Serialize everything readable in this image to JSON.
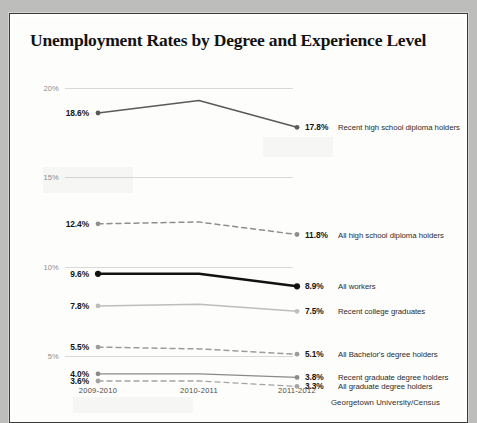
{
  "chart_data": {
    "type": "line",
    "title": "Unemployment Rates by Degree and Experience Level",
    "xlabel": "",
    "ylabel": "",
    "ylim": [
      2.5,
      21.0
    ],
    "yticks": [
      "20%",
      "15%",
      "10%",
      "5%"
    ],
    "ytick_values": [
      20,
      15,
      10,
      5
    ],
    "grid": true,
    "legend_position": "right-of-endpoints",
    "categories": [
      "2009-2010",
      "2010-2011",
      "2011-2012"
    ],
    "source": "Georgetown University/Census",
    "series": [
      {
        "name": "Recent high school diploma holders",
        "values": [
          18.6,
          19.3,
          17.8
        ],
        "start_label": "18.6%",
        "end_label": "17.8%",
        "style": "solid",
        "color": "#5a5a5a",
        "width": 1.6
      },
      {
        "name": "All high school diploma holders",
        "values": [
          12.4,
          12.5,
          11.8
        ],
        "start_label": "12.4%",
        "end_label": "11.8%",
        "style": "dashed",
        "color": "#8e8e8e",
        "width": 1.5
      },
      {
        "name": "All workers",
        "values": [
          9.6,
          9.6,
          8.9
        ],
        "start_label": "9.6%",
        "end_label": "8.9%",
        "style": "solid",
        "color": "#121212",
        "width": 2.4
      },
      {
        "name": "Recent college graduates",
        "values": [
          7.8,
          7.9,
          7.5
        ],
        "start_label": "7.8%",
        "end_label": "7.5%",
        "style": "solid",
        "color": "#bdbdbd",
        "width": 1.6
      },
      {
        "name": "All Bachelor's degree holders",
        "values": [
          5.5,
          5.4,
          5.1
        ],
        "start_label": "5.5%",
        "end_label": "5.1%",
        "style": "dashed",
        "color": "#9c9c9c",
        "width": 1.5
      },
      {
        "name": "Recent graduate degree holders",
        "values": [
          4.0,
          4.0,
          3.8
        ],
        "start_label": "4.0%",
        "end_label": "3.8%",
        "style": "solid",
        "color": "#8a8a8a",
        "width": 1.4
      },
      {
        "name": "All graduate degree holders",
        "values": [
          3.6,
          3.6,
          3.3
        ],
        "start_label": "3.6%",
        "end_label": "3.3%",
        "style": "dashed",
        "color": "#a3a3a3",
        "width": 1.4
      }
    ]
  }
}
